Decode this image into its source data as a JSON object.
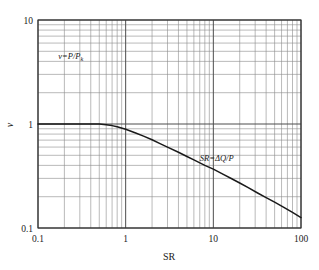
{
  "figure": {
    "background_color": "#ffffff",
    "curve_color": "#1a1a1a",
    "major_grid_color": "#4d4d4d",
    "minor_grid_color": "#8c8c8c",
    "axis_color": "#333333"
  },
  "chart_data": {
    "type": "line",
    "title": "",
    "xlabel": "SR",
    "ylabel": "v",
    "xscale": "log",
    "yscale": "log",
    "xlim": [
      0.1,
      100
    ],
    "ylim": [
      0.1,
      10
    ],
    "grid": true,
    "minor_grid": true,
    "legend": "none",
    "xticks": [
      0.1,
      1,
      10,
      100
    ],
    "xticklabels": [
      "0.1",
      "1",
      "10",
      "100"
    ],
    "yticks": [
      0.1,
      1,
      10
    ],
    "yticklabels": [
      "0.1",
      "1",
      "10"
    ],
    "series": [
      {
        "name": "v vs SR",
        "x": [
          0.1,
          0.2,
          0.3,
          0.4,
          0.5,
          0.6,
          0.7,
          0.8,
          1.0,
          1.3,
          1.6,
          2.0,
          2.5,
          3.0,
          4.0,
          5.0,
          6.0,
          8.0,
          10.0,
          13.0,
          16.0,
          20.0,
          25.0,
          32.0,
          40.0,
          50.0,
          63.0,
          80.0,
          100.0
        ],
        "y": [
          1.0,
          1.0,
          1.0,
          1.0,
          1.0,
          0.985,
          0.965,
          0.94,
          0.89,
          0.82,
          0.765,
          0.705,
          0.645,
          0.6,
          0.535,
          0.487,
          0.452,
          0.4,
          0.368,
          0.328,
          0.299,
          0.271,
          0.244,
          0.217,
          0.196,
          0.177,
          0.159,
          0.141,
          0.126
        ]
      }
    ],
    "annotations": [
      {
        "name": "v-definition",
        "text": "v=P/P",
        "subscript": "k",
        "x_data": 0.17,
        "y_data": 4.2
      },
      {
        "name": "sr-definition",
        "text": "SR=ΔQ/P",
        "x_data": 7.0,
        "y_data": 0.44
      }
    ]
  },
  "axis_titles": {
    "x": "SR",
    "y": "v"
  }
}
